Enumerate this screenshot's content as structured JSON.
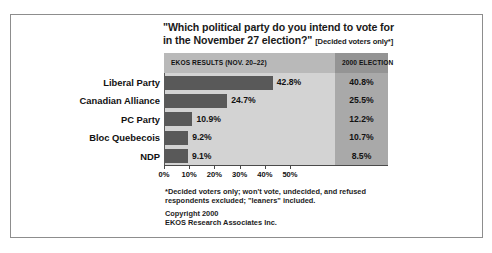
{
  "chart_data": {
    "type": "bar",
    "title": "\"Which political party do you intend to vote for in the November 27 election?\"",
    "title_line1": "\"Which political party do you intend to vote for",
    "title_line2": "in the November 27 election?\"",
    "title_note": "[Decided voters only*]",
    "xlabel": "",
    "ylabel": "",
    "xlim": [
      0,
      57
    ],
    "grid": false,
    "orientation": "horizontal",
    "categories": [
      "Liberal Party",
      "Canadian Alliance",
      "PC Party",
      "Bloc Quebecois",
      "NDP"
    ],
    "columns": [
      "EKOS RESULTS (NOV. 20–22)",
      "2000 ELECTION"
    ],
    "series": [
      {
        "name": "EKOS RESULTS (NOV. 20–22)",
        "values": [
          42.8,
          24.7,
          10.9,
          9.2,
          9.1
        ],
        "labels": [
          "42.8%",
          "24.7%",
          "10.9%",
          "9.2%",
          "9.1%"
        ]
      },
      {
        "name": "2000 ELECTION",
        "values": [
          40.8,
          25.5,
          12.2,
          10.7,
          8.5
        ],
        "labels": [
          "40.8%",
          "25.5%",
          "12.2%",
          "10.7%",
          "8.5%"
        ]
      }
    ],
    "xticks": [
      0,
      10,
      20,
      30,
      40,
      50
    ],
    "xticklabels": [
      "0%",
      "10%",
      "20%",
      "30%",
      "40%",
      "50%"
    ],
    "annotations": [
      "*Decided voters only; won't vote, undecided, and refused respondents excluded; \"leaners\" included.",
      "Copyright 2000",
      "EKOS Research Associates Inc."
    ],
    "colors": {
      "bar": "#595959",
      "plot_panel": "#d3d3d3",
      "election_column": "#a9a9a9",
      "header_band": "#b9b9b9",
      "header_band_right": "#949494",
      "border": "#8d8d8d",
      "text": "#111111"
    }
  },
  "footnote": {
    "line1": "*Decided voters only; won't vote, undecided, and refused",
    "line2": "respondents excluded; \"leaners\" included."
  },
  "copyright": {
    "line1": "Copyright 2000",
    "line2": "EKOS Research Associates Inc."
  }
}
